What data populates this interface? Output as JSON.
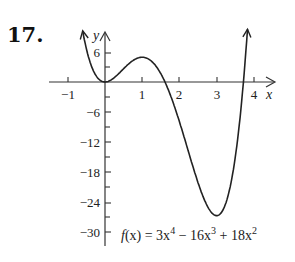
{
  "problem_number": "17.",
  "chart_data": {
    "type": "line",
    "title": "",
    "function_label": "f(x) = 3x^4 − 16x^3 + 18x^2",
    "function_label_parts": {
      "prefix": "f(x) = 3x",
      "exp1": "4",
      "mid1": " − 16x",
      "exp2": "3",
      "mid2": " + 18x",
      "exp3": "2"
    },
    "xlabel": "x",
    "ylabel": "y",
    "xlim": [
      -1.2,
      4.5
    ],
    "ylim": [
      -31,
      10
    ],
    "x_ticks": [
      -1,
      1,
      2,
      3,
      4
    ],
    "x_tick_labels": [
      "−1",
      "1",
      "2",
      "3",
      "4"
    ],
    "y_ticks": [
      6,
      -6,
      -12,
      -18,
      -24,
      -30
    ],
    "y_tick_labels": [
      "6",
      "−6",
      "−12",
      "−18",
      "−24",
      "−30"
    ],
    "y_minor_ticks": [
      3,
      -3,
      -9,
      -15,
      -21,
      -27
    ],
    "grid": false,
    "series": [
      {
        "name": "f(x)",
        "x": [
          -0.6,
          -0.4,
          -0.2,
          0,
          0.25,
          0.5,
          0.75,
          1,
          1.25,
          1.5,
          1.75,
          2,
          2.25,
          2.5,
          2.75,
          3,
          3.25,
          3.5,
          3.75,
          3.83
        ],
        "values": [
          10.3,
          4.0,
          0.85,
          0,
          0.89,
          2.69,
          4.44,
          5,
          3.54,
          -0.56,
          -7.01,
          -8,
          -13.9,
          -20.3,
          -25.5,
          -27,
          -22.6,
          -9.2,
          5.0,
          10.3
        ]
      }
    ],
    "key_points": [
      {
        "x": 0,
        "y": 0,
        "label": "local min"
      },
      {
        "x": 1,
        "y": 5,
        "label": "local max"
      },
      {
        "x": 3,
        "y": -27,
        "label": "absolute min"
      }
    ]
  }
}
